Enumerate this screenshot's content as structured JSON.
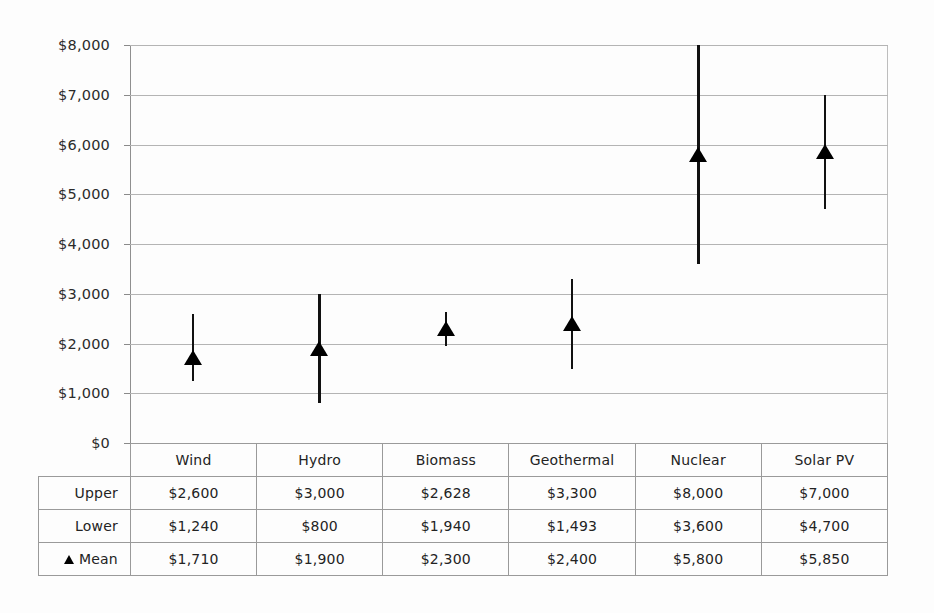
{
  "chart_data": {
    "type": "scatter",
    "title": "",
    "xlabel": "",
    "ylabel": "",
    "ylim": [
      0,
      8000
    ],
    "ytick_labels": [
      "$8,000",
      "$7,000",
      "$6,000",
      "$5,000",
      "$4,000",
      "$3,000",
      "$2,000",
      "$1,000",
      "$0"
    ],
    "ytick_values": [
      8000,
      7000,
      6000,
      5000,
      4000,
      3000,
      2000,
      1000,
      0
    ],
    "grid": true,
    "legend_position": "none",
    "categories": [
      "Wind",
      "Hydro",
      "Biomass",
      "Geothermal",
      "Nuclear",
      "Solar PV"
    ],
    "series": [
      {
        "name": "Upper",
        "values": [
          2600,
          3000,
          2628,
          3300,
          8000,
          7000
        ]
      },
      {
        "name": "Lower",
        "values": [
          1240,
          800,
          1940,
          1493,
          3600,
          4700
        ]
      },
      {
        "name": "Mean",
        "values": [
          1710,
          1900,
          2300,
          2400,
          5800,
          5850
        ]
      }
    ],
    "marker": "filled-triangle-up",
    "marker_color": "#000000"
  },
  "table": {
    "row_labels": [
      "Upper",
      "Lower",
      "Mean"
    ],
    "mean_row_marker": "triangle-up-icon",
    "columns": [
      "Wind",
      "Hydro",
      "Biomass",
      "Geothermal",
      "Nuclear",
      "Solar PV"
    ],
    "rows": [
      {
        "label": "Upper",
        "cells": [
          "$2,600",
          "$3,000",
          "$2,628",
          "$3,300",
          "$8,000",
          "$7,000"
        ]
      },
      {
        "label": "Lower",
        "cells": [
          "$1,240",
          "$800",
          "$1,940",
          "$1,493",
          "$3,600",
          "$4,700"
        ]
      },
      {
        "label": "Mean",
        "cells": [
          "$1,710",
          "$1,900",
          "$2,300",
          "$2,400",
          "$5,800",
          "$5,850"
        ]
      }
    ]
  },
  "colors": {
    "marker": "#000000",
    "errorbar": "#111111",
    "gridline": "#b4b4b4",
    "axis": "#8a8a8a",
    "background": "#fdfdfd"
  }
}
